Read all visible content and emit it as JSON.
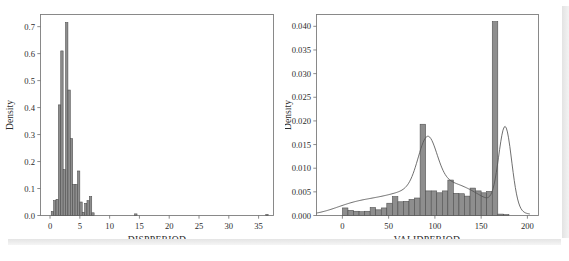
{
  "figure": {
    "background_color": "#ffffff",
    "bar_fill_color": "#8e8e8e",
    "bar_edge_color": "#4a4a4a",
    "kde_line_color": "#555555",
    "frame_color": "#7d7d7d"
  },
  "chart_data": [
    {
      "id": "dispperiod",
      "type": "bar",
      "title": "",
      "subtitle": "",
      "xlabel": "DISPPERIOD",
      "ylabel": "Density",
      "xlim": [
        -1.6,
        37.5
      ],
      "ylim": [
        0.0,
        0.745
      ],
      "grid": false,
      "legend": null,
      "xticks": [
        0,
        5,
        10,
        15,
        20,
        25,
        30,
        35
      ],
      "xticklabels": [
        "0",
        "5",
        "10",
        "15",
        "20",
        "25",
        "30",
        "35"
      ],
      "yticks": [
        0.0,
        0.1,
        0.2,
        0.3,
        0.4,
        0.5,
        0.6,
        0.7
      ],
      "yticklabels": [
        "0.0",
        "0.1",
        "0.2",
        "0.3",
        "0.4",
        "0.5",
        "0.6",
        "0.7"
      ],
      "bin_width": 0.4,
      "bin_starts": [
        0.2,
        0.6,
        1.0,
        1.4,
        1.8,
        2.2,
        2.6,
        3.0,
        3.4,
        3.8,
        4.2,
        4.6,
        5.0,
        5.4,
        5.8,
        6.2,
        6.6,
        7.0,
        14.2,
        36.2
      ],
      "values": [
        0.015,
        0.055,
        0.06,
        0.41,
        0.61,
        0.17,
        0.715,
        0.465,
        0.285,
        0.115,
        0.115,
        0.165,
        0.05,
        0.012,
        0.045,
        0.055,
        0.07,
        0.01,
        0.006,
        0.004
      ],
      "notes": "Right-skewed histogram with sharp peaks near 3; long sparse tail out to ~36"
    },
    {
      "id": "validperiod",
      "type": "bar",
      "title": "",
      "subtitle": "",
      "xlabel": "VALIDPERIOD",
      "ylabel": "Density",
      "xlim": [
        -28,
        212
      ],
      "ylim": [
        0.0,
        0.0425
      ],
      "grid": false,
      "legend": null,
      "xticks": [
        0,
        50,
        100,
        150,
        200
      ],
      "xticklabels": [
        "0",
        "50",
        "100",
        "150",
        "200"
      ],
      "yticks": [
        0.0,
        0.005,
        0.01,
        0.015,
        0.02,
        0.025,
        0.03,
        0.035,
        0.04
      ],
      "yticklabels": [
        "0.000",
        "0.005",
        "0.010",
        "0.015",
        "0.020",
        "0.025",
        "0.030",
        "0.035",
        "0.040"
      ],
      "bin_width": 6.0,
      "bin_starts": [
        0,
        6,
        12,
        18,
        24,
        30,
        36,
        42,
        48,
        54,
        60,
        66,
        72,
        78,
        84,
        90,
        96,
        102,
        108,
        114,
        120,
        126,
        132,
        138,
        144,
        150,
        156,
        162,
        168,
        174
      ],
      "values": [
        0.0016,
        0.0011,
        0.0009,
        0.0008,
        0.0009,
        0.0017,
        0.0012,
        0.0016,
        0.0026,
        0.004,
        0.0029,
        0.003,
        0.0034,
        0.0037,
        0.0193,
        0.0052,
        0.0052,
        0.0048,
        0.0052,
        0.0075,
        0.0047,
        0.0046,
        0.0041,
        0.0058,
        0.0052,
        0.0048,
        0.0051,
        0.041,
        0.0003,
        0.0002
      ],
      "kde_note": "Smooth density overlay peaks ~0.0101 near x=90 and ~0.0173 near x=176, decaying to 0 by x=200"
    }
  ]
}
